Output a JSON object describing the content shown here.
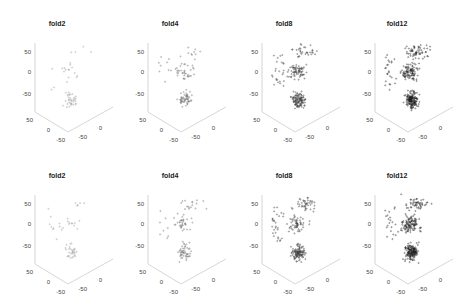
{
  "chart_data": [
    {
      "type": "scatter",
      "subtype": "3d",
      "row": 1,
      "title": "fold2",
      "density": "sparse",
      "point_count_estimate": 60,
      "zticks": [
        "50",
        "0",
        "-50"
      ],
      "xticks": [
        "50",
        "0",
        "-50"
      ],
      "yticks": [
        "-50",
        "0",
        "50"
      ],
      "xlim": [
        -50,
        50
      ],
      "ylim": [
        -50,
        50
      ],
      "zlim": [
        -50,
        50
      ],
      "grid": false
    },
    {
      "type": "scatter",
      "subtype": "3d",
      "row": 1,
      "title": "fold4",
      "density": "light",
      "point_count_estimate": 120,
      "zticks": [
        "50",
        "0",
        "-50"
      ],
      "xticks": [
        "50",
        "0",
        "-50"
      ],
      "yticks": [
        "-50",
        "0",
        "50"
      ],
      "xlim": [
        -50,
        50
      ],
      "ylim": [
        -50,
        50
      ],
      "zlim": [
        -50,
        50
      ],
      "grid": false
    },
    {
      "type": "scatter",
      "subtype": "3d",
      "row": 1,
      "title": "fold8",
      "density": "medium",
      "point_count_estimate": 250,
      "zticks": [
        "50",
        "0",
        "-50"
      ],
      "xticks": [
        "50",
        "0",
        "-50"
      ],
      "yticks": [
        "-50",
        "0",
        "50"
      ],
      "xlim": [
        -50,
        50
      ],
      "ylim": [
        -50,
        50
      ],
      "zlim": [
        -50,
        50
      ],
      "grid": false
    },
    {
      "type": "scatter",
      "subtype": "3d",
      "row": 1,
      "title": "fold12",
      "density": "dense",
      "point_count_estimate": 350,
      "zticks": [
        "50",
        "0",
        "-50"
      ],
      "xticks": [
        "50",
        "0",
        "-50"
      ],
      "yticks": [
        "-50",
        "0",
        "50"
      ],
      "xlim": [
        -50,
        50
      ],
      "ylim": [
        -50,
        50
      ],
      "zlim": [
        -50,
        50
      ],
      "grid": false
    },
    {
      "type": "scatter",
      "subtype": "3d",
      "row": 2,
      "title": "fold2",
      "density": "sparse",
      "point_count_estimate": 60,
      "zticks": [
        "50",
        "0",
        "-50"
      ],
      "xticks": [
        "50",
        "0",
        "-50"
      ],
      "yticks": [
        "-50",
        "0",
        "50"
      ],
      "xlim": [
        -50,
        50
      ],
      "ylim": [
        -50,
        50
      ],
      "zlim": [
        -50,
        50
      ],
      "grid": false
    },
    {
      "type": "scatter",
      "subtype": "3d",
      "row": 2,
      "title": "fold4",
      "density": "light",
      "point_count_estimate": 120,
      "zticks": [
        "50",
        "0",
        "-50"
      ],
      "xticks": [
        "50",
        "0",
        "-50"
      ],
      "yticks": [
        "-50",
        "0",
        "50"
      ],
      "xlim": [
        -50,
        50
      ],
      "ylim": [
        -50,
        50
      ],
      "zlim": [
        -50,
        50
      ],
      "grid": false
    },
    {
      "type": "scatter",
      "subtype": "3d",
      "row": 2,
      "title": "fold8",
      "density": "medium",
      "point_count_estimate": 250,
      "zticks": [
        "50",
        "0",
        "-50"
      ],
      "xticks": [
        "50",
        "0",
        "-50"
      ],
      "yticks": [
        "-50",
        "0",
        "50"
      ],
      "xlim": [
        -50,
        50
      ],
      "ylim": [
        -50,
        50
      ],
      "zlim": [
        -50,
        50
      ],
      "grid": false
    },
    {
      "type": "scatter",
      "subtype": "3d",
      "row": 2,
      "title": "fold12",
      "density": "dense",
      "point_count_estimate": 350,
      "zticks": [
        "50",
        "0",
        "-50"
      ],
      "xticks": [
        "50",
        "0",
        "-50"
      ],
      "yticks": [
        "-50",
        "0",
        "50"
      ],
      "xlim": [
        -50,
        50
      ],
      "ylim": [
        -50,
        50
      ],
      "zlim": [
        -50,
        50
      ],
      "grid": false
    }
  ],
  "panels": [
    {
      "title": "fold2"
    },
    {
      "title": "fold4"
    },
    {
      "title": "fold8"
    },
    {
      "title": "fold12"
    },
    {
      "title": "fold2"
    },
    {
      "title": "fold4"
    },
    {
      "title": "fold8"
    },
    {
      "title": "fold12"
    }
  ],
  "ticks": {
    "z": [
      "50",
      "0",
      "-50"
    ],
    "left": [
      "50",
      "0",
      "-50"
    ],
    "right": [
      "-50",
      "0",
      "50"
    ]
  }
}
